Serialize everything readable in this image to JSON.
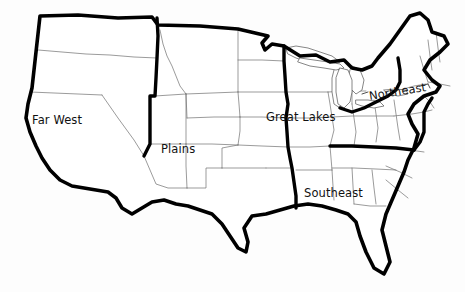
{
  "map": {
    "title": "United States Regions Map",
    "background_color": "#fdfdfd",
    "outline_color": "#000000",
    "state_border_color": "#707070",
    "label_color": "#111111",
    "outline_width_px": 3.6,
    "state_border_width_px": 0.7,
    "projection_note": "contiguous United States, 48 states"
  },
  "regions": [
    {
      "id": "far-west",
      "label": "Far West",
      "label_x": 32,
      "label_y": 114,
      "rotation_deg": 0,
      "has_leader_line": false
    },
    {
      "id": "plains",
      "label": "Plains",
      "label_x": 161,
      "label_y": 143,
      "rotation_deg": 0,
      "has_leader_line": false
    },
    {
      "id": "great-lakes",
      "label": "Great Lakes",
      "label_x": 266,
      "label_y": 111,
      "rotation_deg": 0,
      "has_leader_line": false
    },
    {
      "id": "northeast",
      "label": "Northeast",
      "label_x": 369,
      "label_y": 90,
      "rotation_deg": -9,
      "has_leader_line": true
    },
    {
      "id": "southeast",
      "label": "Southeast",
      "label_x": 304,
      "label_y": 187,
      "rotation_deg": 0,
      "has_leader_line": false
    }
  ],
  "features": {
    "great_lakes_name": "Great Lakes water bodies",
    "peninsula_names": [
      "Florida peninsula",
      "Michigan lower peninsula",
      "Michigan upper peninsula",
      "Cape Cod",
      "Delmarva peninsula"
    ],
    "label_count": 5,
    "state_count": 48
  }
}
